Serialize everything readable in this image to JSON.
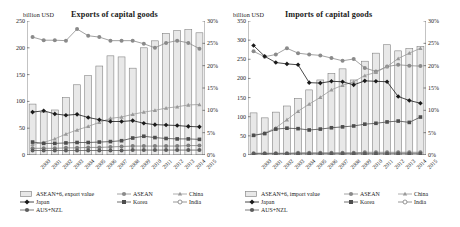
{
  "figure": {
    "panels": [
      {
        "id": "exports",
        "title": "Exports of capital goods",
        "y_unit": "billion USD",
        "legend_bar_label": "ASEAN+6, export value",
        "legend": [
          "ASEAN",
          "China",
          "Japan",
          "Korea",
          "India",
          "AUS+NZL"
        ]
      },
      {
        "id": "imports",
        "title": "Imports of capital goods",
        "y_unit": "billion USD",
        "legend_bar_label": "ASEAN+6, import value",
        "legend": [
          "ASEAN",
          "China",
          "Japan",
          "Korea",
          "India",
          "AUS+NZL"
        ]
      }
    ]
  },
  "chart_data": [
    {
      "type": "bar",
      "id": "exports-of-capital-goods",
      "title": "Exports of capital goods",
      "xlabel": "",
      "ylabel": "billion USD",
      "y2label": "%",
      "ylim": [
        0,
        250
      ],
      "yticks": [
        0,
        50,
        100,
        150,
        200,
        250
      ],
      "ytick_labels": [
        "0",
        "50",
        "100",
        "150",
        "200",
        "250"
      ],
      "y2lim": [
        0,
        30
      ],
      "y2ticks": [
        0,
        5,
        10,
        15,
        20,
        25,
        30
      ],
      "y2tick_labels": [
        "0%",
        "5%",
        "10%",
        "15%",
        "20%",
        "25%",
        "30%"
      ],
      "grid": false,
      "legend_position": "below",
      "categories": [
        "2000",
        "2001",
        "2002",
        "2003",
        "2004",
        "2005",
        "2006",
        "2007",
        "2008",
        "2009",
        "2010",
        "2011",
        "2012",
        "2013",
        "2014",
        "2015"
      ],
      "bars": {
        "name": "ASEAN+6, export value",
        "unit": "billion USD",
        "axis": "left",
        "color": "#e8e8e8",
        "edge_color": "#7a7a7a",
        "values": [
          95,
          80,
          84,
          107,
          131,
          148,
          166,
          185,
          183,
          162,
          200,
          213,
          227,
          232,
          234,
          228
        ]
      },
      "series": [
        {
          "name": "ASEAN",
          "axis": "right",
          "unit": "%",
          "color": "#8a8a8a",
          "marker": "circle",
          "values": [
            26.4,
            25.7,
            25.7,
            25.6,
            28.2,
            26.7,
            26.4,
            25.6,
            25.6,
            25.6,
            24.9,
            24.0,
            25.1,
            25.6,
            25.1,
            23.8
          ]
        },
        {
          "name": "China",
          "axis": "right",
          "unit": "%",
          "color": "#9a9a9a",
          "marker": "triangle",
          "values": [
            2.4,
            2.8,
            3.6,
            4.7,
            5.6,
            6.4,
            7.3,
            8.2,
            8.5,
            9.1,
            9.6,
            10.0,
            10.5,
            10.8,
            11.2,
            11.3
          ]
        },
        {
          "name": "Japan",
          "axis": "right",
          "unit": "%",
          "color": "#1a1a1a",
          "marker": "diamond",
          "values": [
            9.6,
            9.9,
            9.2,
            8.9,
            9.1,
            8.4,
            7.9,
            7.5,
            7.5,
            7.7,
            7.1,
            6.8,
            6.7,
            6.6,
            6.4,
            6.3
          ]
        },
        {
          "name": "Korea",
          "axis": "right",
          "unit": "%",
          "color": "#4d4d4d",
          "marker": "square",
          "values": [
            2.9,
            2.6,
            2.6,
            2.7,
            2.8,
            2.8,
            2.9,
            3.0,
            3.2,
            3.8,
            4.2,
            3.9,
            3.7,
            3.6,
            3.6,
            3.5
          ]
        },
        {
          "name": "India",
          "axis": "right",
          "unit": "%",
          "color": "#7d7d7d",
          "marker": "circle",
          "values": [
            1.5,
            1.5,
            1.5,
            1.6,
            1.6,
            1.7,
            1.7,
            1.8,
            1.9,
            2.0,
            2.0,
            2.0,
            2.0,
            2.0,
            2.1,
            2.1
          ]
        },
        {
          "name": "AUS+NZL",
          "axis": "right",
          "unit": "%",
          "color": "#5c5c5c",
          "marker": "circle",
          "values": [
            1.0,
            1.0,
            1.0,
            1.0,
            1.0,
            1.0,
            1.0,
            1.0,
            1.0,
            1.1,
            1.1,
            1.1,
            1.1,
            1.1,
            1.1,
            1.1
          ]
        }
      ]
    },
    {
      "type": "bar",
      "id": "imports-of-capital-goods",
      "title": "Imports of capital goods",
      "xlabel": "",
      "ylabel": "billion USD",
      "y2label": "%",
      "ylim": [
        0,
        350
      ],
      "yticks": [
        0,
        50,
        100,
        150,
        200,
        250,
        300,
        350
      ],
      "ytick_labels": [
        "0",
        "50",
        "100",
        "150",
        "200",
        "250",
        "300",
        "350"
      ],
      "y2lim": [
        0,
        30
      ],
      "y2ticks": [
        0,
        5,
        10,
        15,
        20,
        25,
        30
      ],
      "y2tick_labels": [
        "0%",
        "5%",
        "10%",
        "15%",
        "20%",
        "25%",
        "30%"
      ],
      "grid": false,
      "legend_position": "below",
      "categories": [
        "2000",
        "2001",
        "2002",
        "2003",
        "2004",
        "2005",
        "2006",
        "2007",
        "2008",
        "2009",
        "2010",
        "2011",
        "2012",
        "2013",
        "2014",
        "2015"
      ],
      "bars": {
        "name": "ASEAN+6, import value",
        "unit": "billion USD",
        "axis": "left",
        "color": "#e8e8e8",
        "edge_color": "#7a7a7a",
        "values": [
          110,
          97,
          112,
          128,
          148,
          170,
          196,
          213,
          225,
          196,
          245,
          266,
          288,
          272,
          278,
          283
        ]
      },
      "series": [
        {
          "name": "ASEAN",
          "axis": "right",
          "unit": "%",
          "color": "#8a8a8a",
          "marker": "circle",
          "values": [
            23.2,
            22.0,
            22.5,
            23.9,
            22.8,
            22.5,
            22.3,
            21.7,
            21.1,
            21.5,
            19.5,
            18.7,
            19.8,
            20.2,
            20.0,
            19.9
          ]
        },
        {
          "name": "China",
          "axis": "right",
          "unit": "%",
          "color": "#9a9a9a",
          "marker": "triangle",
          "values": [
            4.4,
            4.9,
            6.1,
            7.9,
            9.8,
            11.4,
            12.9,
            14.6,
            15.6,
            16.4,
            17.8,
            18.5,
            19.8,
            21.6,
            22.8,
            23.9
          ]
        },
        {
          "name": "Japan",
          "axis": "right",
          "unit": "%",
          "color": "#1a1a1a",
          "marker": "diamond",
          "values": [
            24.5,
            22.1,
            20.7,
            20.4,
            20.2,
            16.2,
            16.1,
            16.5,
            16.4,
            15.7,
            16.6,
            16.5,
            16.4,
            13.1,
            12.2,
            11.6
          ]
        },
        {
          "name": "Korea",
          "axis": "right",
          "unit": "%",
          "color": "#4d4d4d",
          "marker": "square",
          "values": [
            4.4,
            4.8,
            5.8,
            6.0,
            5.9,
            5.6,
            5.8,
            6.1,
            6.3,
            6.5,
            6.9,
            7.1,
            7.4,
            7.6,
            7.3,
            8.5
          ]
        },
        {
          "name": "India",
          "axis": "right",
          "unit": "%",
          "color": "#7d7d7d",
          "marker": "circle",
          "values": [
            0.4,
            0.4,
            0.4,
            0.4,
            0.5,
            0.5,
            0.5,
            0.5,
            0.5,
            0.5,
            0.6,
            0.6,
            0.6,
            0.6,
            0.6,
            0.6
          ]
        },
        {
          "name": "AUS+NZL",
          "axis": "right",
          "unit": "%",
          "color": "#5c5c5c",
          "marker": "circle",
          "values": [
            0.3,
            0.3,
            0.3,
            0.3,
            0.3,
            0.3,
            0.3,
            0.3,
            0.3,
            0.3,
            0.3,
            0.3,
            0.3,
            0.3,
            0.3,
            0.3
          ]
        }
      ]
    }
  ]
}
